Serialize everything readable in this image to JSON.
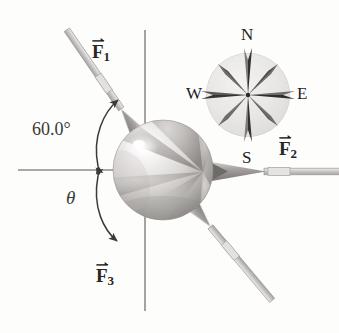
{
  "figure": {
    "background_color": "#fdfdfc",
    "width": 339,
    "height": 333
  },
  "axes": {
    "horizontal_name": "horizontal-axis-line",
    "vertical_name": "vertical-axis-line",
    "color": "#8a8a8a"
  },
  "ball": {
    "name": "beach-ball",
    "center_x": 163,
    "center_y": 170,
    "radius": 50,
    "light_color": "#e8e6e4",
    "dark_color": "#a9a7a6",
    "highlight_color": "#ffffff"
  },
  "vectors": [
    {
      "id": "f1",
      "label_main": "F",
      "label_sub": "1",
      "label_x": 92,
      "label_y": 42,
      "direction": "up-left from ball",
      "color": "#8c8a89"
    },
    {
      "id": "f2",
      "label_main": "F",
      "label_sub": "2",
      "label_x": 279,
      "label_y": 139,
      "direction": "right of ball pointing left",
      "color": "#8c8a89"
    },
    {
      "id": "f3",
      "label_main": "F",
      "label_sub": "3",
      "label_x": 96,
      "label_y": 266,
      "direction": "down-left from ball",
      "color": "#8c8a89"
    }
  ],
  "angles": [
    {
      "id": "angle-60",
      "text": "60.0°",
      "x": 32,
      "y": 120,
      "between": "horizontal axis and F1"
    },
    {
      "id": "angle-theta",
      "text": "θ",
      "x": 66,
      "y": 188,
      "between": "horizontal axis and F3"
    }
  ],
  "compass": {
    "name": "compass-rose",
    "center_x": 248,
    "center_y": 95,
    "radius": 42,
    "disc_color": "#e9e8e6",
    "star_color": "#4c4a49",
    "points": [
      {
        "id": "north",
        "text": "N",
        "x": 241,
        "y": 26
      },
      {
        "id": "west",
        "text": "W",
        "x": 186,
        "y": 85
      },
      {
        "id": "east",
        "text": "E",
        "x": 297,
        "y": 85
      },
      {
        "id": "south",
        "text": "S",
        "x": 242,
        "y": 149
      }
    ]
  }
}
